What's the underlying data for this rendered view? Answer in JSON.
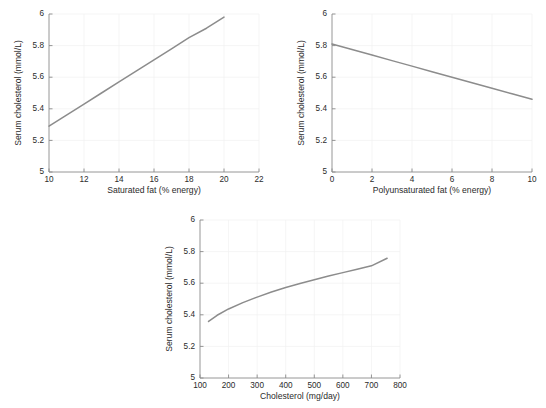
{
  "figure": {
    "background": "#ffffff",
    "line_color": "#8c8c8c",
    "grid_color": "#f0f0f0",
    "axis_color": "#8a8a8a"
  },
  "chart_data": [
    {
      "type": "line",
      "title": "",
      "xlabel": "Saturated fat (% energy)",
      "ylabel": "Serum cholesterol (mmol/L)",
      "xlim": [
        10,
        22
      ],
      "ylim": [
        5,
        6
      ],
      "xticks": [
        10,
        12,
        14,
        16,
        18,
        20,
        22
      ],
      "xticklabels": [
        "10",
        "12",
        "14",
        "16",
        "18",
        "20",
        "22"
      ],
      "yticks": [
        5,
        5.2,
        5.4,
        5.6,
        5.8,
        6
      ],
      "yticklabels": [
        "5",
        "5.2",
        "5.4",
        "5.6",
        "5.8",
        "6"
      ],
      "grid": true,
      "legend": "none",
      "x": [
        10,
        11,
        12,
        13,
        14,
        15,
        16,
        17,
        18,
        19,
        20
      ],
      "y": [
        5.29,
        5.36,
        5.43,
        5.5,
        5.57,
        5.64,
        5.71,
        5.78,
        5.85,
        5.91,
        5.98
      ]
    },
    {
      "type": "line",
      "title": "",
      "xlabel": "Polyunsaturated fat (% energy)",
      "ylabel": "Serum cholesterol (mmol/L)",
      "xlim": [
        0,
        10
      ],
      "ylim": [
        5,
        6
      ],
      "xticks": [
        0,
        2,
        4,
        6,
        8,
        10
      ],
      "xticklabels": [
        "0",
        "2",
        "4",
        "6",
        "8",
        "10"
      ],
      "yticks": [
        5,
        5.2,
        5.4,
        5.6,
        5.8,
        6
      ],
      "yticklabels": [
        "5",
        "5.2",
        "5.4",
        "5.6",
        "5.8",
        "6"
      ],
      "grid": true,
      "legend": "none",
      "x": [
        0,
        1,
        2,
        3,
        4,
        5,
        6,
        7,
        8,
        9,
        10
      ],
      "y": [
        5.81,
        5.775,
        5.74,
        5.705,
        5.67,
        5.635,
        5.6,
        5.565,
        5.53,
        5.495,
        5.46
      ]
    },
    {
      "type": "line",
      "title": "",
      "xlabel": "Cholesterol (mg/day)",
      "ylabel": "Serum cholesterol (mmol/L)",
      "xlim": [
        100,
        800
      ],
      "ylim": [
        5,
        6
      ],
      "xticks": [
        100,
        200,
        300,
        400,
        500,
        600,
        700,
        800
      ],
      "xticklabels": [
        "100",
        "200",
        "300",
        "400",
        "500",
        "600",
        "700",
        "800"
      ],
      "yticks": [
        5,
        5.2,
        5.4,
        5.6,
        5.8,
        6
      ],
      "yticklabels": [
        "5",
        "5.2",
        "5.4",
        "5.6",
        "5.8",
        "6"
      ],
      "grid": true,
      "legend": "none",
      "x": [
        130,
        160,
        200,
        250,
        300,
        350,
        400,
        450,
        500,
        550,
        600,
        650,
        700,
        755
      ],
      "y": [
        5.358,
        5.397,
        5.437,
        5.477,
        5.512,
        5.544,
        5.573,
        5.598,
        5.622,
        5.645,
        5.667,
        5.688,
        5.71,
        5.758
      ]
    }
  ]
}
